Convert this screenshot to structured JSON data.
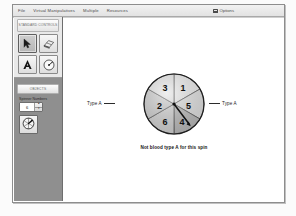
{
  "window": {
    "menu": {
      "items": [
        "File",
        "Virtual Manipulatives",
        "Multiple",
        "Resources"
      ],
      "options_label": "Options",
      "options_icon": "options-icon"
    }
  },
  "sidebar": {
    "standard_controls_header": "STANDARD CONTROLS",
    "tools": [
      {
        "name": "pointer-tool",
        "icon": "arrow-pointer-icon",
        "selected": true
      },
      {
        "name": "eraser-tool",
        "icon": "eraser-icon",
        "selected": false
      },
      {
        "name": "text-tool",
        "icon": "letter-a-icon",
        "selected": false
      },
      {
        "name": "spinner-tool",
        "icon": "spinner-dial-icon",
        "selected": false
      }
    ],
    "objects_header": "OBJECTS",
    "spinner_numbers_label": "Spinner Numbers",
    "spinner_numbers_value": "6",
    "stepper_up": "▴",
    "stepper_down": "▾",
    "object_icon": "spinner-object-icon"
  },
  "stage": {
    "spinner": {
      "sectors": [
        {
          "label": "1",
          "start_deg": 0,
          "end_deg": 60,
          "fill": "#e4e4e4"
        },
        {
          "label": "5",
          "start_deg": 60,
          "end_deg": 120,
          "fill": "#d8d8d8"
        },
        {
          "label": "4",
          "start_deg": 120,
          "end_deg": 180,
          "fill": "#a8a8a8"
        },
        {
          "label": "6",
          "start_deg": 180,
          "end_deg": 240,
          "fill": "#c4c4c4"
        },
        {
          "label": "2",
          "start_deg": 240,
          "end_deg": 300,
          "fill": "#bdbdbd"
        },
        {
          "label": "3",
          "start_deg": 300,
          "end_deg": 360,
          "fill": "#dcdcdc"
        }
      ],
      "needle_deg": 142
    },
    "label_left": "Type A",
    "label_right": "Type A",
    "caption": "Not blood type A for this spin"
  },
  "colors": {
    "frame_border": "#8d8d8d",
    "sidebar_bg": "#8f8f8f",
    "panel_bg": "#e9e9e9",
    "text": "#1d1d1d"
  }
}
